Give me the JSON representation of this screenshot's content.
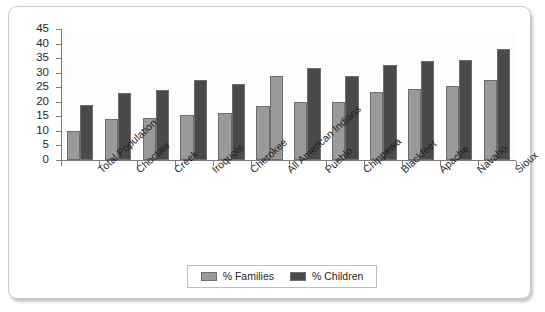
{
  "chart_data": {
    "type": "bar",
    "title": "",
    "xlabel": "",
    "ylabel": "",
    "ylim": [
      0,
      45
    ],
    "ytick_step": 5,
    "yticks": [
      45,
      40,
      35,
      30,
      25,
      20,
      15,
      10,
      5,
      0
    ],
    "grid": false,
    "legend_position": "bottom",
    "categories": [
      "Total Population",
      "Choctaw",
      "Creek",
      "Iroquois",
      "Cherokee",
      "All American Indians",
      "Pueblo",
      "Chippewa",
      "Blackfeet",
      "Apache",
      "Navaho",
      "Sioux"
    ],
    "series": [
      {
        "name": "% Families",
        "color": "#9a9a9a",
        "values": [
          10,
          14,
          14.5,
          15.5,
          16,
          18.5,
          20,
          20,
          23.5,
          24.5,
          25.5,
          27.5
        ]
      },
      {
        "name": "% Children",
        "color": "#4a4a4a",
        "values": [
          19,
          23,
          24,
          27.5,
          26,
          29,
          31.5,
          29,
          32.5,
          34,
          34.5,
          38
        ]
      }
    ],
    "highlighted_category": "All American Indians",
    "highlight_color": "#9a9a9a"
  },
  "legend": {
    "items": [
      {
        "label": "% Families",
        "color": "#9a9a9a"
      },
      {
        "label": "% Children",
        "color": "#4a4a4a"
      }
    ]
  },
  "colors": {
    "families": "#9a9a9a",
    "children": "#4a4a4a",
    "axis": "#7d7d7d",
    "frame_border": "#c9c9c9",
    "text": "#1e1e1e"
  }
}
